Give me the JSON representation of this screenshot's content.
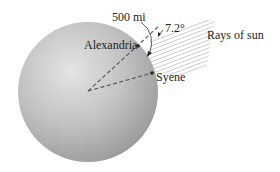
{
  "figure": {
    "labels": {
      "distance": "500 mi",
      "angle": "7.2°",
      "city_north": "Alexandria",
      "city_south": "Syene",
      "rays": "Rays of sun"
    },
    "colors": {
      "sphere_light": "#e6e6e6",
      "sphere_mid": "#bdbdbd",
      "sphere_dark": "#8f8f8f",
      "dashed_line": "#555555",
      "ray_line": "#b5b5b5",
      "text": "#222222"
    }
  }
}
